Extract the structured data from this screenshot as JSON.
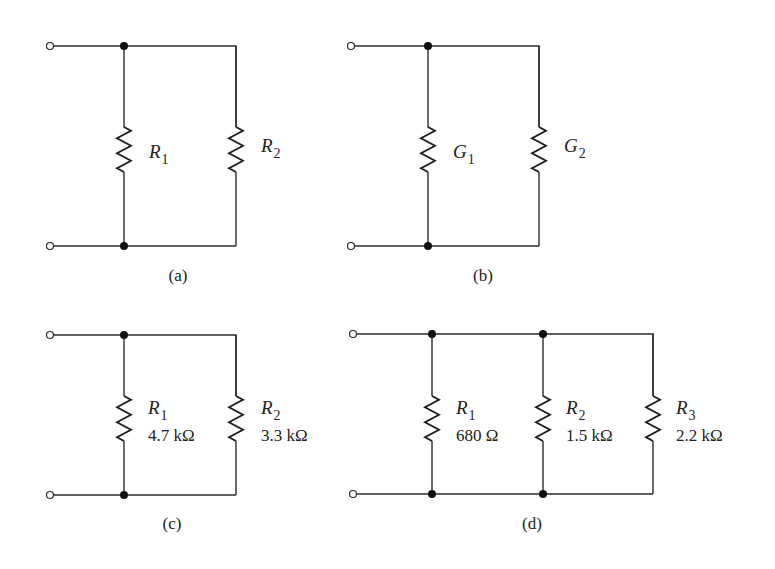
{
  "figure": {
    "background": "#ffffff",
    "line_color": "#2b2b2b",
    "circuits": [
      {
        "id": "a",
        "caption": "(a)",
        "caption_pos": [
          178,
          281
        ],
        "top_y": 46,
        "bottom_y": 246,
        "terminal_x": 50,
        "right_x": 236,
        "junctions_x": [
          124
        ],
        "branches": [
          {
            "x": 124,
            "zig_top": 127,
            "zig_bottom": 172,
            "symbol": "R",
            "subscript": "1",
            "value": "",
            "label_x": 149,
            "label_y": 158
          },
          {
            "x": 236,
            "zig_top": 127,
            "zig_bottom": 172,
            "symbol": "R",
            "subscript": "2",
            "value": "",
            "label_x": 261,
            "label_y": 152
          }
        ]
      },
      {
        "id": "b",
        "caption": "(b)",
        "caption_pos": [
          483,
          281
        ],
        "top_y": 46,
        "bottom_y": 246,
        "terminal_x": 351,
        "right_x": 539,
        "junctions_x": [
          428
        ],
        "branches": [
          {
            "x": 428,
            "zig_top": 127,
            "zig_bottom": 172,
            "symbol": "G",
            "subscript": "1",
            "value": "",
            "label_x": 453,
            "label_y": 158
          },
          {
            "x": 539,
            "zig_top": 127,
            "zig_bottom": 172,
            "symbol": "G",
            "subscript": "2",
            "value": "",
            "label_x": 564,
            "label_y": 152
          }
        ]
      },
      {
        "id": "c",
        "caption": "(c)",
        "caption_pos": [
          172,
          529
        ],
        "top_y": 335,
        "bottom_y": 495,
        "terminal_x": 50,
        "right_x": 236,
        "junctions_x": [
          124
        ],
        "branches": [
          {
            "x": 124,
            "zig_top": 396,
            "zig_bottom": 441,
            "symbol": "R",
            "subscript": "1",
            "value": "4.7 kΩ",
            "label_x": 148,
            "label_y": 414
          },
          {
            "x": 236,
            "zig_top": 396,
            "zig_bottom": 441,
            "symbol": "R",
            "subscript": "2",
            "value": "3.3 kΩ",
            "label_x": 261,
            "label_y": 414
          }
        ]
      },
      {
        "id": "d",
        "caption": "(d)",
        "caption_pos": [
          532,
          529
        ],
        "top_y": 334,
        "bottom_y": 494,
        "terminal_x": 353,
        "right_x": 653,
        "junctions_x": [
          432,
          543
        ],
        "branches": [
          {
            "x": 432,
            "zig_top": 396,
            "zig_bottom": 441,
            "symbol": "R",
            "subscript": "1",
            "value": "680 Ω",
            "label_x": 456,
            "label_y": 414
          },
          {
            "x": 543,
            "zig_top": 396,
            "zig_bottom": 441,
            "symbol": "R",
            "subscript": "2",
            "value": "1.5 kΩ",
            "label_x": 566,
            "label_y": 414
          },
          {
            "x": 653,
            "zig_top": 396,
            "zig_bottom": 441,
            "symbol": "R",
            "subscript": "3",
            "value": "2.2 kΩ",
            "label_x": 676,
            "label_y": 414
          }
        ]
      }
    ]
  }
}
